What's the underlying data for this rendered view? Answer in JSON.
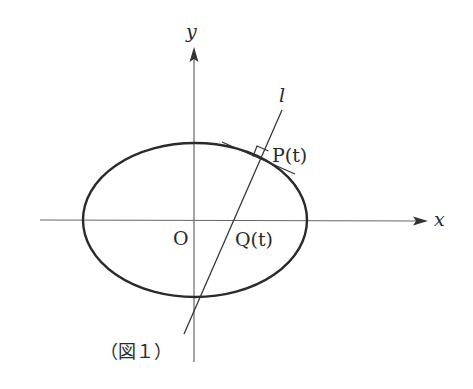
{
  "figure": {
    "caption": "（図１）",
    "labels": {
      "x_axis": "x",
      "y_axis": "y",
      "origin": "O",
      "line": "l",
      "point_p": "P(t)",
      "point_q": "Q(t)"
    },
    "colors": {
      "ink": "#2a2a2a",
      "axis": "#555555",
      "background": "#ffffff"
    },
    "elements": [
      "ellipse centered at origin",
      "x-axis with arrow",
      "y-axis with arrow",
      "tangent line at P(t)",
      "normal line l through P(t) meeting x-axis at Q(t)",
      "right-angle marker at P(t)"
    ]
  }
}
